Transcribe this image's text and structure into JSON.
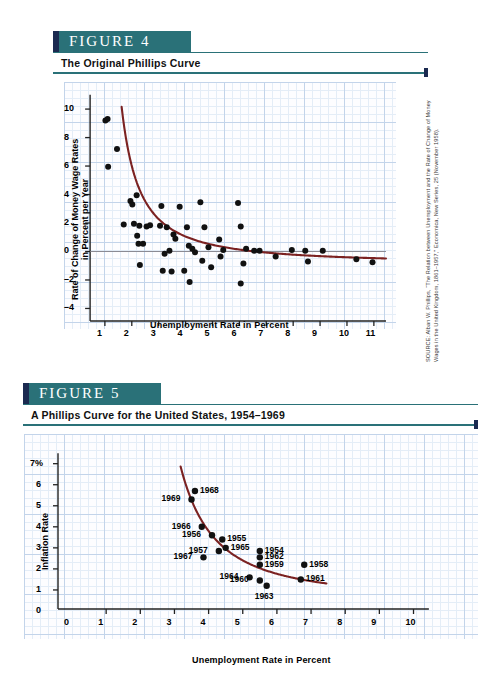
{
  "figure4": {
    "tab_label": "FIGURE  4",
    "subtitle": "The Original Phillips Curve",
    "xlabel": "Unemployment Rate in Percent",
    "ylabel_line1": "Rate of Change of Money Wage Rates",
    "ylabel_line2": "in Percent per Year",
    "source": "SOURCE: Alban W. Phillips, “The Relation between Unemployment and the Rate of Change of Money Wages in the United Kingdom, 1861–1957,” Economica, New Series, 25 (November 1958).",
    "xticks": [
      "1",
      "2",
      "3",
      "4",
      "5",
      "6",
      "7",
      "8",
      "9",
      "10",
      "11"
    ],
    "yticks": [
      "10",
      "8",
      "6",
      "4",
      "2",
      "0",
      "–2",
      "–4"
    ]
  },
  "figure5": {
    "tab_label": "FIGURE  5",
    "subtitle": "A Phillips Curve for the United States, 1954–1969",
    "xlabel": "Unemployment Rate in Percent",
    "ylabel": "Inflation Rate",
    "xticks": [
      "0",
      "1",
      "2",
      "3",
      "4",
      "5",
      "6",
      "7",
      "8",
      "9",
      "10"
    ],
    "yticks": [
      "7%",
      "6",
      "5",
      "4",
      "3",
      "2",
      "1",
      "0"
    ]
  },
  "colors": {
    "curve": "#7b2222",
    "tab_teal": "#2a7178",
    "tab_navy": "#1b2a50",
    "grid_major": "#c3d4ea",
    "grid_minor": "#e4edf7",
    "point": "#111111"
  },
  "chart_data": [
    {
      "type": "scatter",
      "title": "The Original Phillips Curve",
      "xlabel": "Unemployment Rate in Percent",
      "ylabel": "Rate of Change of Money Wage Rates in Percent per Year",
      "xlim": [
        0,
        11.6
      ],
      "ylim": [
        -4.6,
        11.2
      ],
      "grid": true,
      "legend": null,
      "points": [
        [
          1.02,
          9.2
        ],
        [
          1.1,
          9.3
        ],
        [
          1.45,
          7.2
        ],
        [
          1.12,
          5.95
        ],
        [
          1.95,
          3.55
        ],
        [
          2.02,
          3.3
        ],
        [
          2.18,
          3.95
        ],
        [
          2.08,
          1.95
        ],
        [
          1.7,
          1.9
        ],
        [
          2.28,
          1.8
        ],
        [
          2.2,
          1.1
        ],
        [
          2.25,
          0.55
        ],
        [
          2.55,
          1.75
        ],
        [
          2.68,
          1.85
        ],
        [
          2.42,
          0.55
        ],
        [
          2.3,
          -0.95
        ],
        [
          3.1,
          3.2
        ],
        [
          3.05,
          1.8
        ],
        [
          3.3,
          1.7
        ],
        [
          3.55,
          1.2
        ],
        [
          3.22,
          -0.15
        ],
        [
          3.15,
          -1.35
        ],
        [
          3.4,
          0.05
        ],
        [
          3.62,
          0.9
        ],
        [
          3.48,
          -1.4
        ],
        [
          3.78,
          3.15
        ],
        [
          4.05,
          1.7
        ],
        [
          4.12,
          0.4
        ],
        [
          4.25,
          0.2
        ],
        [
          4.35,
          -0.05
        ],
        [
          3.95,
          -1.35
        ],
        [
          4.15,
          -2.15
        ],
        [
          4.55,
          3.45
        ],
        [
          4.7,
          1.7
        ],
        [
          4.85,
          0.3
        ],
        [
          4.62,
          -0.65
        ],
        [
          4.95,
          -1.1
        ],
        [
          5.25,
          0.85
        ],
        [
          5.4,
          0.1
        ],
        [
          5.3,
          -0.35
        ],
        [
          5.95,
          3.4
        ],
        [
          6.05,
          1.75
        ],
        [
          6.25,
          0.2
        ],
        [
          6.15,
          -0.85
        ],
        [
          6.05,
          -2.25
        ],
        [
          6.55,
          0.05
        ],
        [
          6.75,
          0.05
        ],
        [
          7.35,
          -0.35
        ],
        [
          7.95,
          0.1
        ],
        [
          8.45,
          0.05
        ],
        [
          8.55,
          -0.7
        ],
        [
          9.1,
          0.05
        ],
        [
          10.35,
          -0.55
        ],
        [
          10.95,
          -0.75
        ]
      ],
      "curve_description": "Downward-sloping convex Phillips curve from about (1.1, 11) falling steeply to (2.2, 2) then flattening toward (11, -0.8)"
    },
    {
      "type": "scatter",
      "title": "A Phillips Curve for the United States, 1954–1969",
      "xlabel": "Unemployment Rate in Percent",
      "ylabel": "Inflation Rate",
      "xlim": [
        0,
        10.6
      ],
      "ylim": [
        0,
        7.6
      ],
      "grid": true,
      "legend": null,
      "labelled_points": [
        {
          "year": "1968",
          "x": 3.6,
          "y": 5.7,
          "label_side": "right"
        },
        {
          "year": "1969",
          "x": 3.5,
          "y": 5.3,
          "label_side": "left"
        },
        {
          "year": "1966",
          "x": 3.8,
          "y": 4.0,
          "label_side": "left"
        },
        {
          "year": "1956",
          "x": 4.1,
          "y": 3.6,
          "label_side": "left"
        },
        {
          "year": "1955",
          "x": 4.4,
          "y": 3.4,
          "label_side": "right"
        },
        {
          "year": "1965",
          "x": 4.5,
          "y": 3.0,
          "label_side": "right"
        },
        {
          "year": "1957",
          "x": 4.3,
          "y": 2.85,
          "label_side": "left"
        },
        {
          "year": "1967",
          "x": 3.85,
          "y": 2.55,
          "label_side": "left"
        },
        {
          "year": "1954",
          "x": 5.5,
          "y": 2.85,
          "label_side": "right"
        },
        {
          "year": "1962",
          "x": 5.5,
          "y": 2.55,
          "label_side": "right"
        },
        {
          "year": "1959",
          "x": 5.5,
          "y": 2.2,
          "label_side": "right"
        },
        {
          "year": "1964",
          "x": 5.2,
          "y": 1.6,
          "label_side": "left"
        },
        {
          "year": "1960",
          "x": 5.5,
          "y": 1.45,
          "label_side": "left"
        },
        {
          "year": "1963",
          "x": 5.7,
          "y": 1.2,
          "label_side": "below"
        },
        {
          "year": "1958",
          "x": 6.8,
          "y": 2.2,
          "label_side": "right"
        },
        {
          "year": "1961",
          "x": 6.7,
          "y": 1.5,
          "label_side": "right"
        }
      ],
      "curve_description": "Convex downward-sloping fitted Phillips curve running from about (3.2, 7.3) to (7.4, 1.0)"
    }
  ]
}
